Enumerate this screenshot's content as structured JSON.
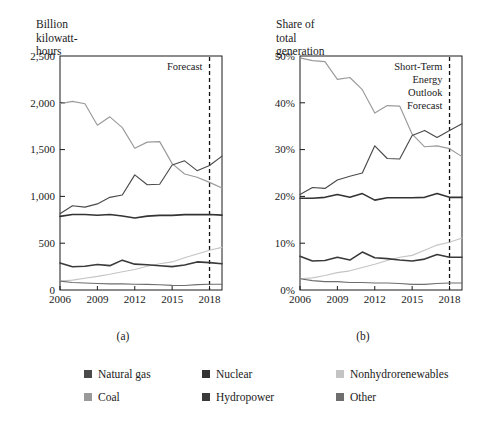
{
  "figure": {
    "panels": [
      {
        "id": "a",
        "subplot_label": "(a)",
        "axis_title": "Billion\nkilowatt-hours",
        "forecast_label": "Forecast"
      },
      {
        "id": "b",
        "subplot_label": "(b)",
        "axis_title": "Share of\ntotal generation",
        "forecast_label": "Short-Term\nEnergy\nOutlook\nForecast"
      }
    ]
  },
  "legend": {
    "position": "bottom",
    "rows": [
      [
        {
          "label": "Natural gas",
          "color": "#4a4a4a",
          "swatch": "legend-swatch-natural-gas"
        },
        {
          "label": "Nuclear",
          "color": "#333333",
          "swatch": "legend-swatch-nuclear"
        },
        {
          "label": "Nonhydrorenewables",
          "color": "#c4c4c4",
          "swatch": "legend-swatch-nonhydrorenewables"
        }
      ],
      [
        {
          "label": "Coal",
          "color": "#9a9a9a",
          "swatch": "legend-swatch-coal"
        },
        {
          "label": "Hydropower",
          "color": "#3a3a3a",
          "swatch": "legend-swatch-hydropower"
        },
        {
          "label": "Other",
          "color": "#6e6e6e",
          "swatch": "legend-swatch-other"
        }
      ]
    ]
  },
  "chart_data": [
    {
      "type": "line",
      "id": "a",
      "title": "",
      "subplot_label": "(a)",
      "xlabel": "",
      "ylabel": "Billion kilowatt-hours",
      "x": [
        2006,
        2007,
        2008,
        2009,
        2010,
        2011,
        2012,
        2013,
        2014,
        2015,
        2016,
        2017,
        2018,
        2019
      ],
      "xlim": [
        2006,
        2019
      ],
      "ylim": [
        0,
        2500
      ],
      "xticks": [
        2006,
        2009,
        2012,
        2015,
        2018
      ],
      "xtick_labels": [
        "2006",
        "2009",
        "2012",
        "2015",
        "2018"
      ],
      "yticks": [
        0,
        500,
        1000,
        1500,
        2000,
        2500
      ],
      "ytick_labels": [
        "0",
        "500",
        "1,000",
        "1,500",
        "2,000",
        "2,500"
      ],
      "grid": false,
      "forecast_boundary": 2018,
      "forecast_label": "Forecast",
      "series": [
        {
          "name": "Coal",
          "color": "#9a9a9a",
          "values": [
            1990,
            2015,
            1990,
            1760,
            1850,
            1735,
            1515,
            1580,
            1585,
            1350,
            1240,
            1205,
            1150,
            1090
          ]
        },
        {
          "name": "Natural gas",
          "color": "#4a4a4a",
          "values": [
            815,
            900,
            885,
            920,
            990,
            1015,
            1230,
            1125,
            1130,
            1335,
            1380,
            1275,
            1330,
            1430
          ]
        },
        {
          "name": "Nuclear",
          "color": "#333333",
          "values": [
            787,
            806,
            806,
            799,
            807,
            790,
            769,
            789,
            797,
            797,
            805,
            805,
            807,
            800
          ]
        },
        {
          "name": "Hydropower",
          "color": "#3a3a3a",
          "values": [
            289,
            248,
            254,
            273,
            260,
            319,
            276,
            269,
            259,
            250,
            267,
            300,
            292,
            280
          ]
        },
        {
          "name": "Nonhydrorenewables",
          "color": "#c4c4c4",
          "values": [
            96,
            105,
            126,
            145,
            168,
            195,
            219,
            254,
            280,
            300,
            345,
            385,
            425,
            455
          ]
        },
        {
          "name": "Other",
          "color": "#6e6e6e",
          "values": [
            95,
            80,
            75,
            70,
            66,
            66,
            62,
            60,
            56,
            50,
            48,
            58,
            62,
            62
          ]
        }
      ]
    },
    {
      "type": "line",
      "id": "b",
      "title": "",
      "subplot_label": "(b)",
      "xlabel": "",
      "ylabel": "Share of total generation",
      "x": [
        2006,
        2007,
        2008,
        2009,
        2010,
        2011,
        2012,
        2013,
        2014,
        2015,
        2016,
        2017,
        2018,
        2019
      ],
      "xlim": [
        2006,
        2019
      ],
      "ylim": [
        0,
        50
      ],
      "xticks": [
        2006,
        2009,
        2012,
        2015,
        2018
      ],
      "xtick_labels": [
        "2006",
        "2009",
        "2012",
        "2015",
        "2018"
      ],
      "yticks": [
        0,
        10,
        20,
        30,
        40,
        50
      ],
      "ytick_labels": [
        "0%",
        "10%",
        "20%",
        "30%",
        "40%",
        "50%"
      ],
      "grid": false,
      "forecast_boundary": 2018,
      "forecast_label": "Short-Term Energy Outlook Forecast",
      "series": [
        {
          "name": "Coal",
          "color": "#9a9a9a",
          "values": [
            49.6,
            49.0,
            48.8,
            45.0,
            45.4,
            42.8,
            37.8,
            39.4,
            39.3,
            33.3,
            30.6,
            30.8,
            30.2,
            28.5
          ]
        },
        {
          "name": "Natural gas",
          "color": "#4a4a4a",
          "values": [
            20.4,
            21.9,
            21.7,
            23.5,
            24.3,
            25.0,
            30.8,
            28.1,
            28.0,
            33.0,
            34.1,
            32.6,
            34.1,
            35.5
          ]
        },
        {
          "name": "Nuclear",
          "color": "#333333",
          "values": [
            19.6,
            19.6,
            19.8,
            20.4,
            19.8,
            20.6,
            19.2,
            19.7,
            19.7,
            19.7,
            19.8,
            20.6,
            19.8,
            19.8
          ]
        },
        {
          "name": "Hydropower",
          "color": "#3a3a3a",
          "values": [
            7.2,
            6.2,
            6.3,
            7.0,
            6.4,
            8.1,
            6.9,
            6.7,
            6.4,
            6.2,
            6.6,
            7.6,
            7.0,
            7.0
          ]
        },
        {
          "name": "Nonhydrorenewables",
          "color": "#c4c4c4",
          "values": [
            2.4,
            2.6,
            3.1,
            3.7,
            4.1,
            4.8,
            5.5,
            6.3,
            7.0,
            7.4,
            8.5,
            9.6,
            10.2,
            11.1
          ]
        },
        {
          "name": "Other",
          "color": "#6e6e6e",
          "values": [
            2.4,
            2.0,
            1.8,
            1.8,
            1.6,
            1.6,
            1.5,
            1.5,
            1.4,
            1.2,
            1.2,
            1.4,
            1.5,
            1.5
          ]
        }
      ]
    }
  ]
}
